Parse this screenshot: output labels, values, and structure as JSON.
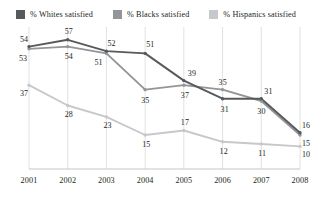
{
  "legend": {
    "position": "top-left",
    "items": [
      {
        "label": "% Whites satisfied",
        "color": "#58595b",
        "swatch": "legend-swatch-whites"
      },
      {
        "label": "% Blacks satisfied",
        "color": "#939598",
        "swatch": "legend-swatch-blacks"
      },
      {
        "label": "% Hispanics satisfied",
        "color": "#c7c8ca",
        "swatch": "legend-swatch-hispanics"
      }
    ]
  },
  "chart_data": {
    "type": "line",
    "title": "",
    "subtitle": "",
    "xlabel": "",
    "ylabel": "",
    "grid": "vertical",
    "ylim": [
      0,
      60
    ],
    "xlim": [
      "2001",
      "2008"
    ],
    "categories": [
      "2001",
      "2002",
      "2003",
      "2004",
      "2005",
      "2006",
      "2007",
      "2008"
    ],
    "series": [
      {
        "name": "% Whites satisfied",
        "color": "#58595b",
        "values": [
          54,
          57,
          52,
          51,
          39,
          31,
          31,
          16
        ]
      },
      {
        "name": "% Blacks satisfied",
        "color": "#939598",
        "values": [
          53,
          54,
          51,
          35,
          37,
          35,
          30,
          15
        ]
      },
      {
        "name": "% Hispanics satisfied",
        "color": "#c7c8ca",
        "values": [
          37,
          28,
          23,
          15,
          17,
          12,
          11,
          10
        ]
      }
    ]
  },
  "axis": {
    "ticks": [
      "2001",
      "2002",
      "2003",
      "2004",
      "2005",
      "2006",
      "2007",
      "2008"
    ],
    "axis_line_color": "#bcbec0",
    "gridline_color": "#d8d9db"
  },
  "labels": {
    "whites": [
      "54",
      "57",
      "52",
      "51",
      "39",
      "31",
      "31",
      "16"
    ],
    "blacks": [
      "53",
      "54",
      "51",
      "35",
      "37",
      "35",
      "30",
      "15"
    ],
    "hispanics": [
      "37",
      "28",
      "23",
      "15",
      "17",
      "12",
      "11",
      "10"
    ]
  }
}
